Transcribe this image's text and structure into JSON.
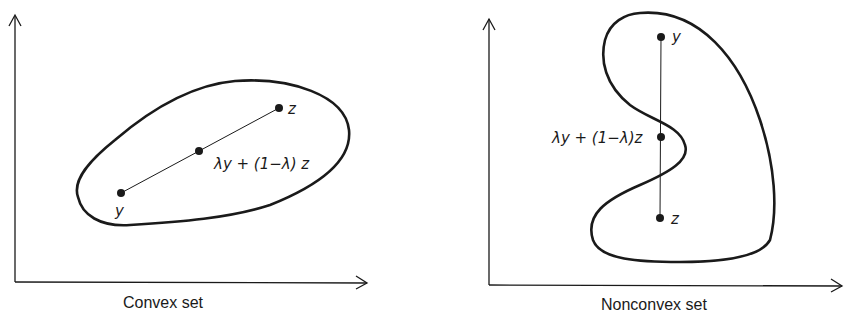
{
  "figure": {
    "panels": [
      {
        "id": "convex",
        "caption": "Convex set",
        "points": {
          "y": {
            "label": "y",
            "x": 121,
            "y": 193
          },
          "mid": {
            "label": "λy + (1−λ) z",
            "x": 199,
            "y": 151
          },
          "z": {
            "label": "z",
            "x": 279,
            "y": 108
          }
        }
      },
      {
        "id": "nonconvex",
        "caption": "Nonconvex set",
        "points": {
          "y": {
            "label": "y",
            "x": 661,
            "y": 37
          },
          "mid": {
            "label": "λy + (1−λ)z",
            "x": 661,
            "y": 137
          },
          "z": {
            "label": "z",
            "x": 660,
            "y": 218
          }
        }
      }
    ],
    "colors": {
      "ink": "#1a1a1a",
      "background": "#ffffff"
    }
  }
}
